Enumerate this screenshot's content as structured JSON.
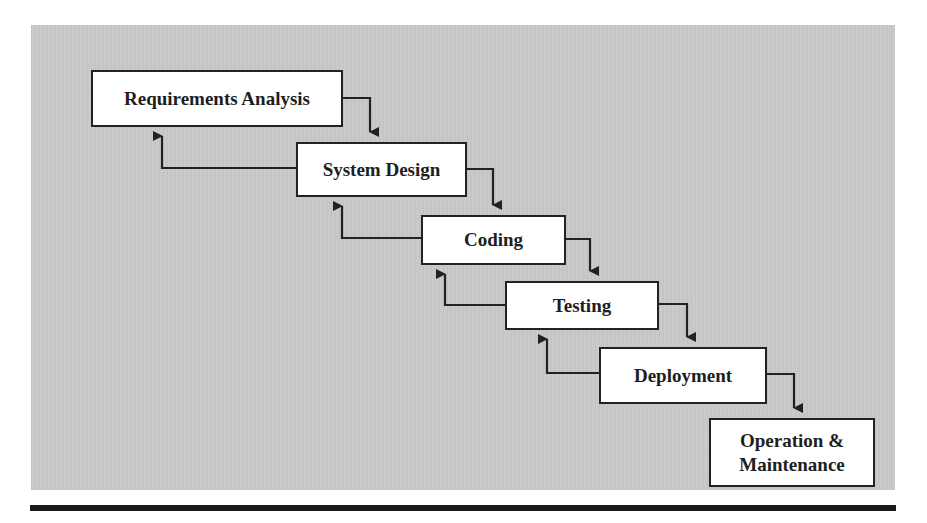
{
  "diagram": {
    "type": "waterfall-model",
    "stages": [
      {
        "id": "requirements",
        "label": "Requirements Analysis"
      },
      {
        "id": "design",
        "label": "System Design"
      },
      {
        "id": "coding",
        "label": "Coding"
      },
      {
        "id": "testing",
        "label": "Testing"
      },
      {
        "id": "deployment",
        "label": "Deployment"
      },
      {
        "id": "operation",
        "label": "Operation &\nMaintenance"
      }
    ],
    "forward_edges": [
      [
        "requirements",
        "design"
      ],
      [
        "design",
        "coding"
      ],
      [
        "coding",
        "testing"
      ],
      [
        "testing",
        "deployment"
      ],
      [
        "deployment",
        "operation"
      ]
    ],
    "feedback_edges": [
      [
        "design",
        "requirements"
      ],
      [
        "coding",
        "design"
      ],
      [
        "testing",
        "coding"
      ],
      [
        "deployment",
        "testing"
      ]
    ],
    "colors": {
      "panel_background": "#c8c8c8",
      "box_fill": "#ffffff",
      "box_border": "#222222",
      "line": "#222222",
      "text": "#1e1e1e",
      "rule": "#1a1a1a"
    }
  }
}
